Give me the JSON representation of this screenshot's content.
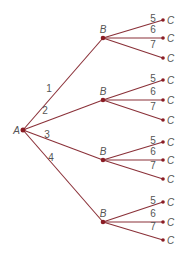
{
  "diagram": {
    "type": "tree",
    "colors": {
      "edge": "#8a3038",
      "node": "#8b1c24",
      "text": "#555555",
      "background": "#ffffff"
    },
    "root": {
      "label": "A",
      "x": 23,
      "y": 130
    },
    "branches": [
      {
        "edge_label": "1",
        "node": {
          "label": "B",
          "x": 103,
          "y": 38
        },
        "children": [
          {
            "edge_label": "5",
            "label": "C",
            "x": 163,
            "y": 20
          },
          {
            "edge_label": "6",
            "label": "C",
            "x": 163,
            "y": 38
          },
          {
            "edge_label": "7",
            "label": "C",
            "x": 163,
            "y": 58
          }
        ]
      },
      {
        "edge_label": "2",
        "node": {
          "label": "B",
          "x": 103,
          "y": 100
        },
        "children": [
          {
            "edge_label": "5",
            "label": "C",
            "x": 163,
            "y": 80
          },
          {
            "edge_label": "6",
            "label": "C",
            "x": 163,
            "y": 100
          },
          {
            "edge_label": "7",
            "label": "C",
            "x": 163,
            "y": 120
          }
        ]
      },
      {
        "edge_label": "3",
        "node": {
          "label": "B",
          "x": 103,
          "y": 160
        },
        "children": [
          {
            "edge_label": "5",
            "label": "C",
            "x": 163,
            "y": 142
          },
          {
            "edge_label": "6",
            "label": "C",
            "x": 163,
            "y": 160
          },
          {
            "edge_label": "7",
            "label": "C",
            "x": 163,
            "y": 179
          }
        ]
      },
      {
        "edge_label": "4",
        "node": {
          "label": "B",
          "x": 103,
          "y": 222
        },
        "children": [
          {
            "edge_label": "5",
            "label": "C",
            "x": 163,
            "y": 202
          },
          {
            "edge_label": "6",
            "label": "C",
            "x": 163,
            "y": 222
          },
          {
            "edge_label": "7",
            "label": "C",
            "x": 163,
            "y": 240
          }
        ]
      }
    ]
  }
}
